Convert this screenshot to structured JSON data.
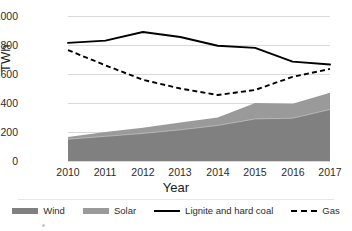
{
  "chart_data": {
    "type": "area",
    "title": "",
    "xlabel": "Year",
    "ylabel": "TWh",
    "categories": [
      2010,
      2011,
      2012,
      2013,
      2014,
      2015,
      2016,
      2017
    ],
    "xlim": [
      2010,
      2017
    ],
    "ylim": [
      0,
      1000
    ],
    "yticks": [
      0,
      200,
      400,
      600,
      800,
      1000
    ],
    "ytick_labels": [
      "0",
      "200",
      "400",
      "600",
      "800",
      "1000"
    ],
    "xtick_labels": [
      "2010",
      "2011",
      "2012",
      "2013",
      "2014",
      "2015",
      "2016",
      "2017"
    ],
    "grid": true,
    "legend_position": "bottom",
    "stacked": true,
    "series": [
      {
        "name": "Wind",
        "kind": "area-stacked",
        "color": "#808080",
        "values": [
          150,
          170,
          190,
          215,
          245,
          290,
          295,
          355
        ]
      },
      {
        "name": "Solar",
        "kind": "area-stacked",
        "color": "#9a9a9a",
        "values": [
          15,
          30,
          40,
          50,
          55,
          110,
          100,
          115
        ]
      },
      {
        "name": "Lignite and hard coal",
        "kind": "line-solid",
        "color": "#000000",
        "values": [
          815,
          830,
          890,
          855,
          795,
          780,
          685,
          665
        ]
      },
      {
        "name": "Gas",
        "kind": "line-dashed",
        "color": "#000000",
        "values": [
          765,
          660,
          560,
          500,
          455,
          490,
          580,
          635
        ]
      }
    ],
    "stacked_totals": [
      165,
      200,
      230,
      265,
      300,
      400,
      395,
      470
    ]
  },
  "legend": {
    "items": [
      {
        "label": "Wind",
        "marker": "area-swatch-dark"
      },
      {
        "label": "Solar",
        "marker": "area-swatch-light"
      },
      {
        "label": "Lignite and hard coal",
        "marker": "solid-line"
      },
      {
        "label": "Gas",
        "marker": "dashed-line"
      }
    ]
  },
  "colors": {
    "wind": "#808080",
    "solar": "#9a9a9a",
    "coal_line": "#000000",
    "gas_line": "#000000",
    "gridline": "#d9d9d9",
    "text": "#2b2b2b"
  }
}
